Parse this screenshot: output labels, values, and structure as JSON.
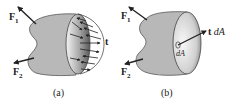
{
  "figure": {
    "panels": [
      {
        "id": "a",
        "caption": "(a)",
        "labels": {
          "force1": "F",
          "force1_sub": "1",
          "force2": "F",
          "force2_sub": "2",
          "traction": "t"
        },
        "description": "Sectioned body with distributed traction vectors on the cut surface"
      },
      {
        "id": "b",
        "caption": "(b)",
        "labels": {
          "force1": "F",
          "force1_sub": "1",
          "force2": "F",
          "force2_sub": "2",
          "traction_bold": "t",
          "traction_area": "dA",
          "area_element": "dA"
        },
        "description": "Sectioned body with single traction force t dA on area element dA"
      }
    ],
    "colors": {
      "body_fill": "#b8b8b8",
      "body_stroke": "#555555",
      "cut_face_light": "#f2f2f2",
      "cut_face_dark": "#7a7a7a",
      "arrow": "#222222"
    }
  }
}
